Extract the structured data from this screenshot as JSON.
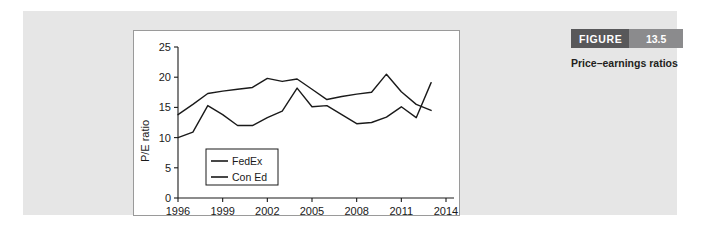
{
  "figure": {
    "banner_label": "FIGURE",
    "banner_number": "13.5",
    "caption": "Price–earnings ratios",
    "banner_dark_color": "#58585a",
    "banner_light_color": "#8b8b8d",
    "panel_color": "#e6e6e6"
  },
  "chart_data": {
    "type": "line",
    "title": "",
    "xlabel": "",
    "ylabel": "P/E ratio",
    "xlim": [
      1996,
      2014
    ],
    "ylim": [
      0,
      25
    ],
    "yticks": [
      0,
      5,
      10,
      15,
      20,
      25
    ],
    "xticks": [
      1996,
      1999,
      2002,
      2005,
      2008,
      2011,
      2014
    ],
    "grid": false,
    "legend_position": "inside-lower-left",
    "line_color": "#1a1a1a",
    "x": [
      1996,
      1997,
      1998,
      1999,
      2000,
      2001,
      2002,
      2003,
      2004,
      2005,
      2006,
      2007,
      2008,
      2009,
      2010,
      2011,
      2012,
      2013
    ],
    "series": [
      {
        "name": "FedEx",
        "values": [
          10.0,
          10.9,
          15.3,
          13.8,
          12.0,
          12.0,
          13.3,
          14.4,
          18.2,
          15.1,
          15.3,
          13.8,
          12.3,
          12.5,
          13.4,
          15.1,
          13.3,
          19.1
        ]
      },
      {
        "name": "Con Ed",
        "values": [
          13.8,
          15.5,
          17.3,
          17.7,
          18.0,
          18.3,
          19.8,
          19.3,
          19.7,
          18.0,
          16.3,
          16.8,
          17.2,
          17.5,
          20.5,
          17.6,
          15.5,
          14.5
        ]
      }
    ]
  }
}
